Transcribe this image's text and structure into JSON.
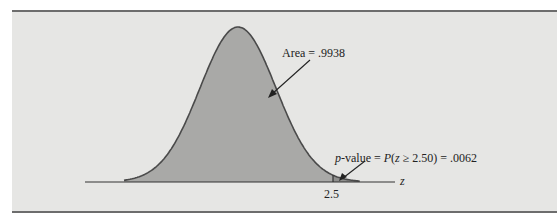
{
  "figure": {
    "background": "#e6e6e4",
    "curve_fill": "#a9a9a7",
    "tail_fill": "#8f8f8d",
    "line_color": "#4a4a4a"
  },
  "chart_data": {
    "type": "area",
    "title": "",
    "xlabel": "z",
    "ylabel": "",
    "x_ticks": [
      2.5
    ],
    "x_tick_labels": [
      "2.5"
    ],
    "distribution": "standard normal",
    "critical_z": 2.5,
    "regions": [
      {
        "name": "Area",
        "range": [
          -3.0,
          2.5
        ],
        "area": 0.9938,
        "label": "Area = .9938"
      },
      {
        "name": "p-value",
        "range": [
          2.5,
          3.2
        ],
        "area": 0.0062,
        "label": "p-value = P(z ≥ 2.50) = .0062"
      }
    ],
    "annotations": [
      {
        "text": "Area = .9938",
        "points_to": "central area"
      },
      {
        "text": "p-value = P(z ≥ 2.50) = .0062",
        "points_to": "upper tail beyond z = 2.5"
      }
    ],
    "grid": false,
    "legend": "none"
  },
  "labels": {
    "area": "Area = .9938",
    "pvalue_prefix_italic": "p",
    "pvalue_mid": "-value = ",
    "pvalue_P": "P",
    "pvalue_open": "(",
    "pvalue_z": "z",
    "pvalue_rest": " ≥ 2.50) = .0062",
    "tick": "2.5",
    "axis": "z"
  }
}
